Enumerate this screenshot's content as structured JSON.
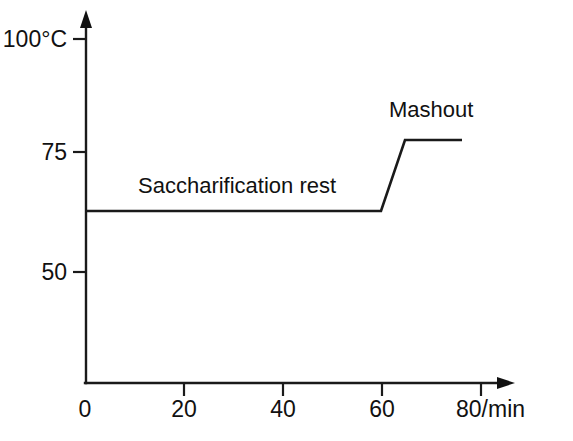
{
  "chart_data": {
    "type": "line",
    "title": "",
    "subtitle": "",
    "xlabel": "/min",
    "ylabel": "°C",
    "xlim": [
      0,
      80
    ],
    "ylim": [
      0,
      100
    ],
    "grid": false,
    "legend": "none",
    "x_ticks": [
      {
        "value": 0,
        "label": "0",
        "px": 85
      },
      {
        "value": 20,
        "label": "20",
        "px": 184
      },
      {
        "value": 40,
        "label": "40",
        "px": 283
      },
      {
        "value": 60,
        "label": "60",
        "px": 382
      },
      {
        "value": 80,
        "label": "80/min",
        "px": 481
      }
    ],
    "y_ticks": [
      {
        "value": 100,
        "label": "100°C",
        "px": 39
      },
      {
        "value": 75,
        "label": "75",
        "px": 152
      },
      {
        "value": 50,
        "label": "50",
        "px": 272
      }
    ],
    "series": [
      {
        "name": "Mash temperature profile",
        "color": "#1a1a1a",
        "x": [
          0,
          59,
          64,
          75
        ],
        "y": [
          62.7,
          62.7,
          77.5,
          77.5
        ],
        "points_px": "86,211 381,211 405,140 462,140"
      }
    ],
    "annotations": [
      {
        "name": "saccharification-rest",
        "text": "Saccharification rest",
        "x_min": 1,
        "x_max": 59,
        "y_value": 62.7,
        "left_px": 138,
        "top_px": 175
      },
      {
        "name": "mashout",
        "text": "Mashout",
        "x_min": 64,
        "x_max": 75,
        "y_value": 77.5,
        "left_px": 389,
        "top_px": 99
      }
    ],
    "axis_colors": {
      "axis": "#1a1a1a",
      "series": "#1a1a1a",
      "background": "#ffffff"
    }
  }
}
